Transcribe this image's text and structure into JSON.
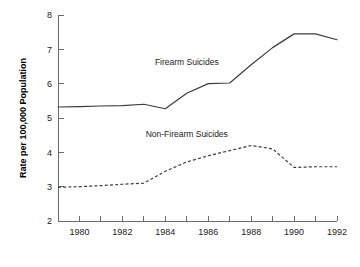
{
  "chart_data": {
    "type": "line",
    "title": "",
    "xlabel": "",
    "ylabel": "Rate per 100,000 Population",
    "xlim": [
      1979,
      1992
    ],
    "ylim": [
      2,
      8
    ],
    "grid": false,
    "legend_position": "inline-annotation",
    "x": [
      1979,
      1980,
      1981,
      1982,
      1983,
      1984,
      1985,
      1986,
      1987,
      1988,
      1989,
      1990,
      1991,
      1992
    ],
    "xticks": [
      1980,
      1982,
      1984,
      1986,
      1988,
      1990,
      1992
    ],
    "xtick_labels": [
      "1980",
      "1982",
      "1984",
      "1986",
      "1988",
      "1990",
      "1992"
    ],
    "xticks_minor": [
      1979,
      1981,
      1983,
      1985,
      1987,
      1989,
      1991
    ],
    "yticks": [
      2,
      3,
      4,
      5,
      6,
      7,
      8
    ],
    "ytick_labels": [
      "2",
      "3",
      "4",
      "5",
      "6",
      "7",
      "8"
    ],
    "series": [
      {
        "name": "Firearm Suicides",
        "style": "solid",
        "color": "#3d3d3d",
        "annotation": "Firearm Suicides",
        "annotation_x": 1985.0,
        "annotation_y": 6.55,
        "values": [
          5.32,
          5.33,
          5.35,
          5.36,
          5.4,
          5.27,
          5.72,
          6.0,
          6.02,
          6.55,
          7.05,
          7.45,
          7.45,
          7.28
        ]
      },
      {
        "name": "Non-Firearm Suicides",
        "style": "dashed",
        "color": "#3d3d3d",
        "annotation": "Non-Firearm Suicides",
        "annotation_x": 1985.0,
        "annotation_y": 4.45,
        "values": [
          2.98,
          3.0,
          3.03,
          3.07,
          3.1,
          3.45,
          3.72,
          3.9,
          4.05,
          4.2,
          4.1,
          3.56,
          3.58,
          3.58
        ]
      }
    ]
  }
}
